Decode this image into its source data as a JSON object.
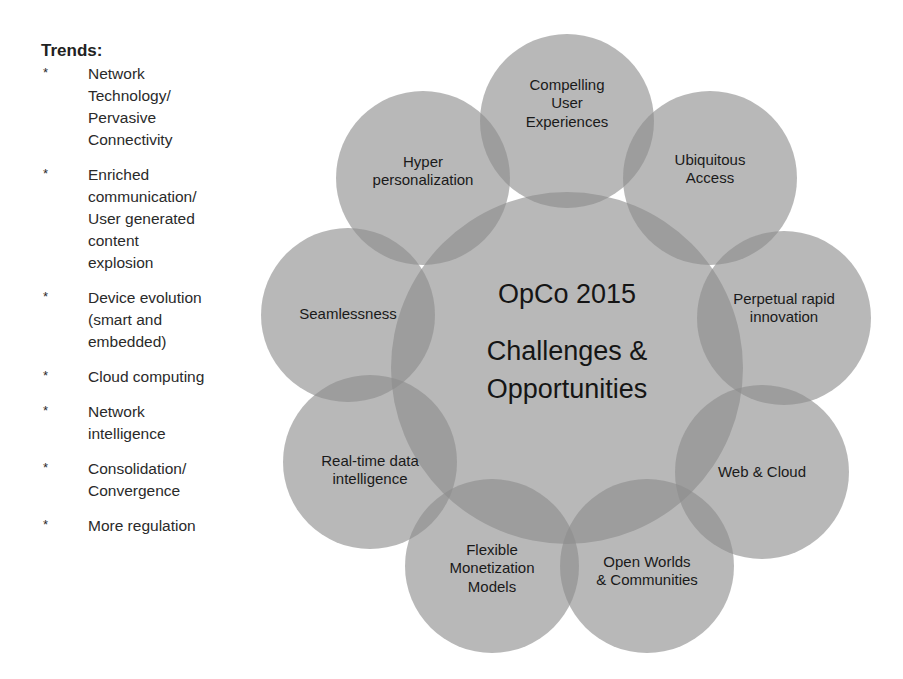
{
  "trends": {
    "title": "Trends:",
    "bullet": "*",
    "items": [
      {
        "text": "Network\nTechnology/\nPervasive\nConnectivity"
      },
      {
        "text": "Enriched\ncommunication/\nUser generated\ncontent\nexplosion"
      },
      {
        "text": "Device evolution\n(smart and\nembedded)"
      },
      {
        "text": "Cloud computing"
      },
      {
        "text": "Network\nintelligence"
      },
      {
        "text": "Consolidation/\nConvergence"
      },
      {
        "text": "More regulation"
      }
    ]
  },
  "diagram": {
    "fill_color": "#8c8c8c",
    "center": {
      "x": 567,
      "y": 368,
      "r": 176,
      "lines": [
        "OpCo 2015",
        "Challenges &",
        "Opportunities"
      ],
      "line_y": [
        303,
        360,
        398
      ],
      "font_size": 27
    },
    "outer_radius": 87,
    "outer_circles": [
      {
        "x": 567,
        "y": 121,
        "lines": [
          "Compelling",
          "User",
          "Experiences"
        ],
        "text_y": 90,
        "font_size": 15
      },
      {
        "x": 710,
        "y": 178,
        "lines": [
          "Ubiquitous",
          "Access"
        ],
        "text_y": 165,
        "font_size": 15
      },
      {
        "x": 784,
        "y": 318,
        "lines": [
          "Perpetual rapid",
          "innovation"
        ],
        "text_y": 304,
        "font_size": 15
      },
      {
        "x": 762,
        "y": 472,
        "lines": [
          "Web & Cloud"
        ],
        "text_y": 477,
        "font_size": 15
      },
      {
        "x": 647,
        "y": 566,
        "lines": [
          "Open Worlds",
          "& Communities"
        ],
        "text_y": 567,
        "font_size": 15
      },
      {
        "x": 492,
        "y": 566,
        "lines": [
          "Flexible",
          "Monetization",
          "Models"
        ],
        "text_y": 555,
        "font_size": 15
      },
      {
        "x": 370,
        "y": 462,
        "lines": [
          "Real-time data",
          "intelligence"
        ],
        "text_y": 466,
        "font_size": 15
      },
      {
        "x": 348,
        "y": 315,
        "lines": [
          "Seamlessness"
        ],
        "text_y": 319,
        "font_size": 15
      },
      {
        "x": 423,
        "y": 178,
        "lines": [
          "Hyper",
          "personalization"
        ],
        "text_y": 167,
        "font_size": 15
      }
    ]
  }
}
